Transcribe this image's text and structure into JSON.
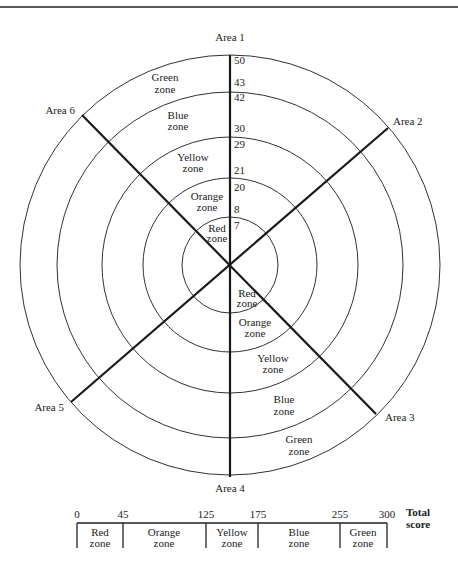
{
  "diagram": {
    "areas": {
      "area1": "Area 1",
      "area2": "Area 2",
      "area3": "Area 3",
      "area4": "Area 4",
      "area5": "Area 5",
      "area6": "Area 6"
    },
    "scale_labels": {
      "s50": "50",
      "s43": "43",
      "s42": "42",
      "s30": "30",
      "s29": "29",
      "s21": "21",
      "s20": "20",
      "s8": "8",
      "s7": "7"
    },
    "zones_upper": {
      "green": {
        "line1": "Green",
        "line2": "zone"
      },
      "blue": {
        "line1": "Blue",
        "line2": "zone"
      },
      "yellow": {
        "line1": "Yellow",
        "line2": "zone"
      },
      "orange": {
        "line1": "Orange",
        "line2": "zone"
      },
      "red": {
        "line1": "Red",
        "line2": "zone"
      }
    },
    "zones_lower": {
      "red": {
        "line1": "Red",
        "line2": "zone"
      },
      "orange": {
        "line1": "Orange",
        "line2": "zone"
      },
      "yellow": {
        "line1": "Yellow",
        "line2": "zone"
      },
      "blue": {
        "line1": "Blue",
        "line2": "zone"
      },
      "green": {
        "line1": "Green",
        "line2": "zone"
      }
    },
    "area_zone_ranges": [
      {
        "zone": "Red",
        "min": 0,
        "max": 7
      },
      {
        "zone": "Orange",
        "min": 8,
        "max": 20
      },
      {
        "zone": "Yellow",
        "min": 21,
        "max": 29
      },
      {
        "zone": "Blue",
        "min": 30,
        "max": 42
      },
      {
        "zone": "Green",
        "min": 43,
        "max": 50
      }
    ]
  },
  "total_score_bar": {
    "title_line1": "Total",
    "title_line2": "score",
    "ticks": {
      "t0": "0",
      "t45": "45",
      "t125": "125",
      "t175": "175",
      "t255": "255",
      "t300": "300"
    },
    "zones": {
      "red": {
        "line1": "Red",
        "line2": "zone"
      },
      "orange": {
        "line1": "Orange",
        "line2": "zone"
      },
      "yellow": {
        "line1": "Yellow",
        "line2": "zone"
      },
      "blue": {
        "line1": "Blue",
        "line2": "zone"
      },
      "green": {
        "line1": "Green",
        "line2": "zone"
      }
    },
    "zone_ranges": [
      {
        "zone": "Red",
        "min": 0,
        "max": 45
      },
      {
        "zone": "Orange",
        "min": 45,
        "max": 125
      },
      {
        "zone": "Yellow",
        "min": 125,
        "max": 175
      },
      {
        "zone": "Blue",
        "min": 175,
        "max": 255
      },
      {
        "zone": "Green",
        "min": 255,
        "max": 300
      }
    ]
  }
}
